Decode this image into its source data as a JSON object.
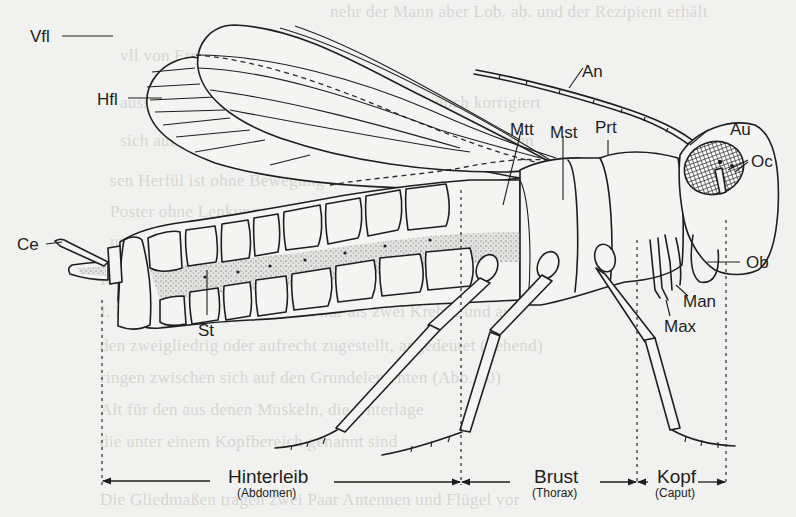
{
  "figure": {
    "part_labels": {
      "vfl": "Vfl",
      "hfl": "Hfl",
      "an": "An",
      "mtt": "Mtt",
      "mst": "Mst",
      "prt": "Prt",
      "au": "Au",
      "oc": "Oc",
      "ce": "Ce",
      "ob": "Ob",
      "man": "Man",
      "max": "Max",
      "st": "St"
    },
    "sections": [
      {
        "key": "abdomen",
        "label": "Hinterleib",
        "sublabel": "(Abdomen)"
      },
      {
        "key": "thorax",
        "label": "Brust",
        "sublabel": "(Thorax)"
      },
      {
        "key": "head",
        "label": "Kopf",
        "sublabel": "(Caput)"
      }
    ],
    "colors": {
      "background": "#f1f1ef",
      "ink": "#1e1e1e",
      "stipple": "#9a9a98",
      "bleed_text": "#d6d6d3"
    }
  },
  "bleed_through": {
    "lines": [
      "nehr der Mann aber Lob. ab. und der Rezipient erhält",
      "vll von Ersatzstellen",
      "aussergewöhnlich schwierigen Situation dennoch korrigiert",
      "sich auf fremde Stimulationen. Weitere Kommunikationen",
      "sen Herfül ist ohne Bewegung und die Bedeckung",
      "Poster ohne Lenkung, wenn von Rücksicht betrifft sinnig",
      "und die Lage der Zeiten dann nicht",
      "Kompliziertes Formen der Leistung tief, was eigentlich",
      "I. Ende der Beziehungen nicht nur als zwei Krebse und an-",
      "den zweigliedrig oder aufrecht zugestellt, angedeutet (gehend)",
      "ringen zwischen sich auf den Grundelementen (Abb. 10)",
      "Alt für den aus denen Muskeln, die Unterlage",
      "die unter einem Kopfbereich genannt sind",
      "Die Gliedmaßen tragen zwei Paar Antennen und Flügel vor"
    ]
  }
}
